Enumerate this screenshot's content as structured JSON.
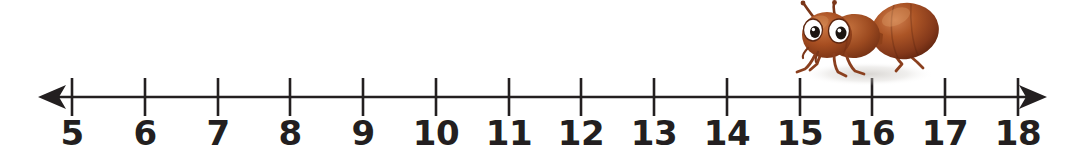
{
  "worksheet": {
    "type": "number-line",
    "background_color": "#ffffff",
    "line_color": "#231f20",
    "label_color": "#231f20"
  },
  "number_line": {
    "start": 5,
    "end": 18,
    "step": 1,
    "left_arrow": true,
    "right_arrow": true,
    "axis_y": 97,
    "first_tick_x": 72,
    "tick_spacing": 72.77,
    "tick_top": 78,
    "tick_bottom": 116,
    "ticks": [
      {
        "value": 5,
        "label": "5",
        "x": 72
      },
      {
        "value": 6,
        "label": "6",
        "x": 145
      },
      {
        "value": 7,
        "label": "7",
        "x": 218
      },
      {
        "value": 8,
        "label": "8",
        "x": 290
      },
      {
        "value": 9,
        "label": "9",
        "x": 363
      },
      {
        "value": 10,
        "label": "10",
        "x": 436
      },
      {
        "value": 11,
        "label": "11",
        "x": 509
      },
      {
        "value": 12,
        "label": "12",
        "x": 581
      },
      {
        "value": 13,
        "label": "13",
        "x": 654
      },
      {
        "value": 14,
        "label": "14",
        "x": 727
      },
      {
        "value": 15,
        "label": "15",
        "x": 800
      },
      {
        "value": 16,
        "label": "16",
        "x": 872
      },
      {
        "value": 17,
        "label": "17",
        "x": 945
      },
      {
        "value": 18,
        "label": "18",
        "x": 1018
      }
    ]
  },
  "illustration": {
    "name": "ant",
    "description": "cartoon ant facing left",
    "position_over_value": 15.5,
    "left": 782,
    "top": -2,
    "width": 170,
    "height": 92,
    "colors": {
      "body_dark": "#7d3218",
      "body_mid": "#a6472012",
      "body_light": "#c9703f",
      "head": "#b0501f",
      "leg": "#8a3f1e",
      "eye_white": "#ffffff",
      "eye_pupil": "#1c1410",
      "shadow": "#d8d4cf"
    }
  }
}
